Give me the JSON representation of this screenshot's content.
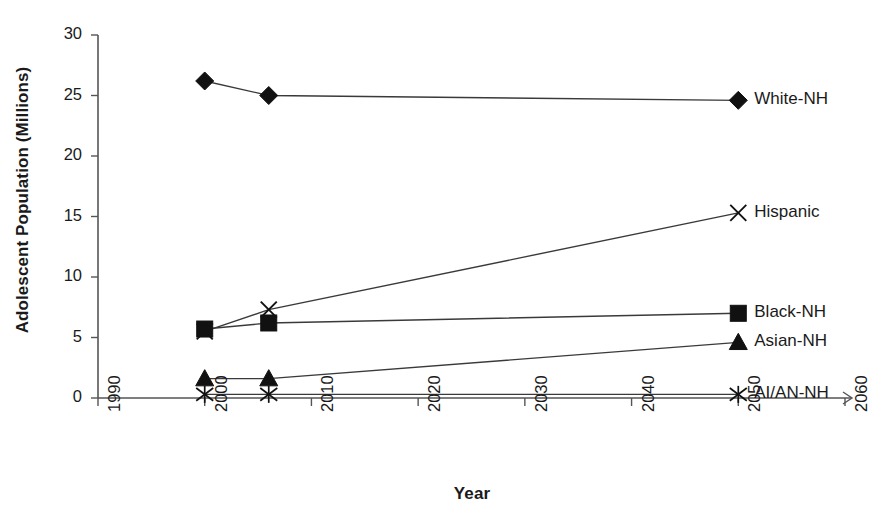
{
  "chart_data": {
    "type": "line",
    "title": "",
    "xlabel": "Year",
    "ylabel": "Adolescent Population (Millions)",
    "xlim": [
      1990,
      2060
    ],
    "ylim": [
      0,
      30
    ],
    "xticks": [
      1990,
      2000,
      2010,
      2020,
      2030,
      2040,
      2050,
      2060
    ],
    "yticks": [
      0,
      5,
      10,
      15,
      20,
      25,
      30
    ],
    "grid": false,
    "legend_position": "right-of-line-ends",
    "x": [
      2000,
      2006,
      2050
    ],
    "series": [
      {
        "name": "White-NH",
        "marker": "diamond",
        "values": [
          26.2,
          25.0,
          24.6
        ]
      },
      {
        "name": "Hispanic",
        "marker": "x",
        "values": [
          5.5,
          7.3,
          15.3
        ]
      },
      {
        "name": "Black-NH",
        "marker": "square",
        "values": [
          5.7,
          6.2,
          7.0
        ]
      },
      {
        "name": "Asian-NH",
        "marker": "triangle",
        "values": [
          1.6,
          1.6,
          4.6
        ]
      },
      {
        "name": "AI/AN-NH",
        "marker": "star",
        "values": [
          0.3,
          0.3,
          0.3
        ]
      }
    ]
  },
  "axes": {
    "y_tick_labels": [
      "0",
      "5",
      "10",
      "15",
      "20",
      "25",
      "30"
    ],
    "x_tick_labels": [
      "1990",
      "2000",
      "2010",
      "2020",
      "2030",
      "2040",
      "2050",
      "2060"
    ],
    "x_title": "Year",
    "y_title": "Adolescent Population (Millions)"
  },
  "legend": {
    "items": [
      {
        "label": "White-NH"
      },
      {
        "label": "Hispanic"
      },
      {
        "label": "Black-NH"
      },
      {
        "label": "Asian-NH"
      },
      {
        "label": "AI/AN-NH"
      }
    ]
  },
  "colors": {
    "line": "#3a3a3a",
    "marker": "#111111",
    "axis": "#555555",
    "text": "#1a1a1a",
    "background": "#ffffff"
  }
}
